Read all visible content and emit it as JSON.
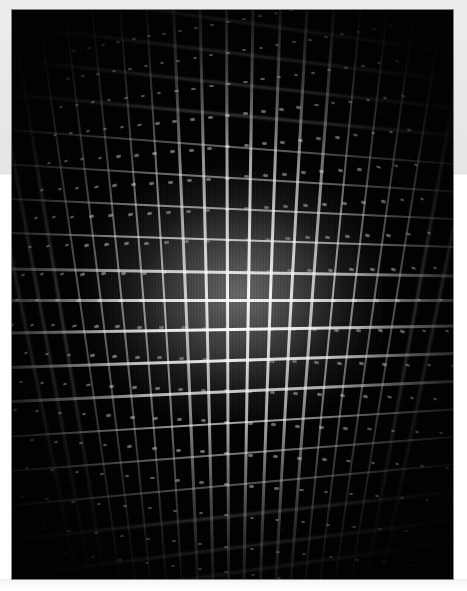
{
  "page": {
    "background_color": "#ffffff",
    "width": 467,
    "height": 591
  },
  "top_band": {
    "name": "upper-gray-margin",
    "color": "#e9e9e9",
    "height": 174
  },
  "bottom_rule": {
    "name": "lower-white-margin",
    "color": "#f7f7f7"
  },
  "photo": {
    "title": "Structured-light laser grid projection",
    "frame_color": "#000000",
    "x": 12,
    "y": 10,
    "width": 441,
    "height": 569,
    "subject": "dot-matrix laser grid",
    "background_color": "#000000",
    "line_color": "#ffffff",
    "glow_color": "#9a9a9a",
    "center_x_pct": 52,
    "center_y_pct": 50,
    "vertical_line_count": 21,
    "horizontal_line_count": 19,
    "notes": "barrel-distorted grid of bright laser lines, continuous near centre, breaking into discrete dots toward the corners"
  },
  "chart_data": {
    "type": "heatmap",
    "xlabel": "",
    "ylabel": "",
    "legend": [],
    "grid": true,
    "vertical_lines": [
      {
        "index": 0,
        "x_pct": 1.5,
        "angle_deg": -11.5,
        "intensity": 0.16
      },
      {
        "index": 1,
        "x_pct": 6.0,
        "angle_deg": -10.4,
        "intensity": 0.19
      },
      {
        "index": 2,
        "x_pct": 10.5,
        "angle_deg": -9.3,
        "intensity": 0.22
      },
      {
        "index": 3,
        "x_pct": 15.2,
        "angle_deg": -8.2,
        "intensity": 0.26
      },
      {
        "index": 4,
        "x_pct": 20.0,
        "angle_deg": -7.0,
        "intensity": 0.31
      },
      {
        "index": 5,
        "x_pct": 24.8,
        "angle_deg": -5.8,
        "intensity": 0.37
      },
      {
        "index": 6,
        "x_pct": 29.6,
        "angle_deg": -4.6,
        "intensity": 0.46
      },
      {
        "index": 7,
        "x_pct": 34.4,
        "angle_deg": -3.5,
        "intensity": 0.58
      },
      {
        "index": 8,
        "x_pct": 39.2,
        "angle_deg": -2.4,
        "intensity": 0.72
      },
      {
        "index": 9,
        "x_pct": 44.0,
        "angle_deg": -1.3,
        "intensity": 0.86
      },
      {
        "index": 10,
        "x_pct": 48.8,
        "angle_deg": -0.2,
        "intensity": 0.95
      },
      {
        "index": 11,
        "x_pct": 53.6,
        "angle_deg": 0.9,
        "intensity": 1.0
      },
      {
        "index": 12,
        "x_pct": 58.4,
        "angle_deg": 2.0,
        "intensity": 0.94
      },
      {
        "index": 13,
        "x_pct": 63.2,
        "angle_deg": 3.1,
        "intensity": 0.84
      },
      {
        "index": 14,
        "x_pct": 68.0,
        "angle_deg": 4.3,
        "intensity": 0.7
      },
      {
        "index": 15,
        "x_pct": 72.8,
        "angle_deg": 5.5,
        "intensity": 0.55
      },
      {
        "index": 16,
        "x_pct": 77.6,
        "angle_deg": 6.7,
        "intensity": 0.43
      },
      {
        "index": 17,
        "x_pct": 82.4,
        "angle_deg": 7.9,
        "intensity": 0.33
      },
      {
        "index": 18,
        "x_pct": 87.2,
        "angle_deg": 9.1,
        "intensity": 0.26
      },
      {
        "index": 19,
        "x_pct": 92.0,
        "angle_deg": 10.3,
        "intensity": 0.21
      },
      {
        "index": 20,
        "x_pct": 97.0,
        "angle_deg": 11.6,
        "intensity": 0.17
      }
    ],
    "horizontal_lines": [
      {
        "index": 0,
        "y_pct": 2.0,
        "angle_deg": 8.0,
        "intensity": 0.12
      },
      {
        "index": 1,
        "y_pct": 7.5,
        "angle_deg": 7.1,
        "intensity": 0.14
      },
      {
        "index": 2,
        "y_pct": 13.0,
        "angle_deg": 6.2,
        "intensity": 0.17
      },
      {
        "index": 3,
        "y_pct": 18.5,
        "angle_deg": 5.3,
        "intensity": 0.21
      },
      {
        "index": 4,
        "y_pct": 24.0,
        "angle_deg": 4.4,
        "intensity": 0.27
      },
      {
        "index": 5,
        "y_pct": 29.5,
        "angle_deg": 3.5,
        "intensity": 0.36
      },
      {
        "index": 6,
        "y_pct": 35.0,
        "angle_deg": 2.6,
        "intensity": 0.5
      },
      {
        "index": 7,
        "y_pct": 40.5,
        "angle_deg": 1.8,
        "intensity": 0.66
      },
      {
        "index": 8,
        "y_pct": 46.0,
        "angle_deg": 0.9,
        "intensity": 0.82
      },
      {
        "index": 9,
        "y_pct": 51.0,
        "angle_deg": 0.0,
        "intensity": 0.95
      },
      {
        "index": 10,
        "y_pct": 56.0,
        "angle_deg": -0.9,
        "intensity": 1.0
      },
      {
        "index": 11,
        "y_pct": 61.5,
        "angle_deg": -1.8,
        "intensity": 0.9
      },
      {
        "index": 12,
        "y_pct": 67.0,
        "angle_deg": -2.6,
        "intensity": 0.74
      },
      {
        "index": 13,
        "y_pct": 72.5,
        "angle_deg": -3.5,
        "intensity": 0.56
      },
      {
        "index": 14,
        "y_pct": 78.0,
        "angle_deg": -4.4,
        "intensity": 0.4
      },
      {
        "index": 15,
        "y_pct": 83.5,
        "angle_deg": -5.3,
        "intensity": 0.28
      },
      {
        "index": 16,
        "y_pct": 89.0,
        "angle_deg": -6.2,
        "intensity": 0.2
      },
      {
        "index": 17,
        "y_pct": 94.5,
        "angle_deg": -7.1,
        "intensity": 0.15
      },
      {
        "index": 18,
        "y_pct": 99.0,
        "angle_deg": -8.0,
        "intensity": 0.12
      }
    ],
    "bloom": {
      "center_x_pct": 52,
      "center_y_pct": 50,
      "radius_x_pct": 34,
      "radius_y_pct": 22,
      "peak_gray": "#9e9e9e"
    }
  }
}
